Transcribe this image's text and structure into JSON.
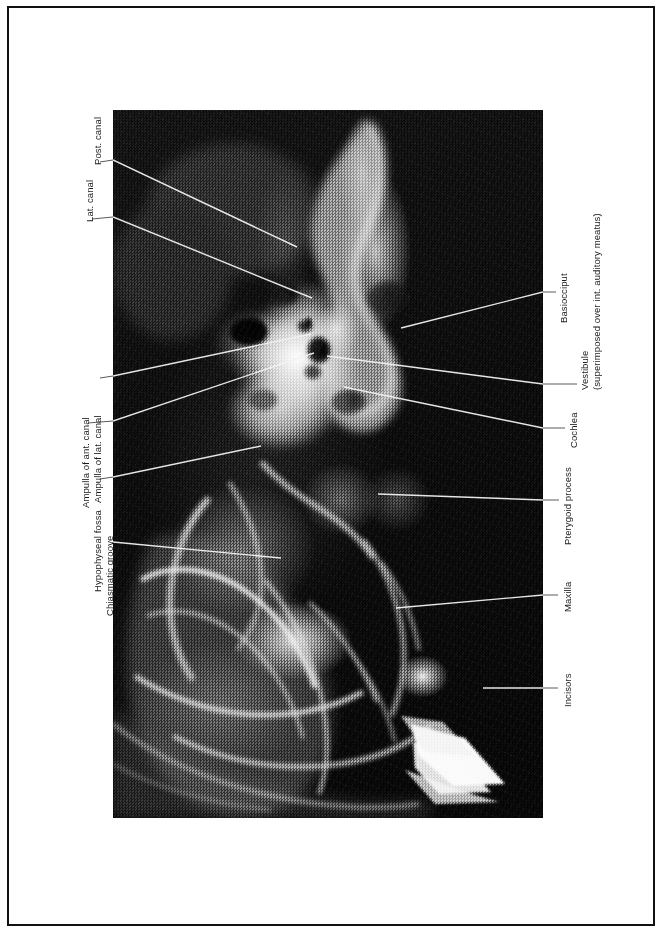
{
  "figure": {
    "kind": "annotated-radiograph",
    "modality": "x-ray",
    "orientation": "rotated-90-ccw",
    "page_background": "#ffffff",
    "border_color": "#111111",
    "label_color": "#1a1a1a",
    "leader_color_on_film": "#f2f2f2",
    "leader_color_on_page": "#5a5a5a",
    "film_color": "#0a0a0a"
  },
  "labels": {
    "left": [
      {
        "id": "post-canal",
        "text": "Post. canal"
      },
      {
        "id": "lat-canal",
        "text": "Lat. canal"
      },
      {
        "id": "ampulla-lat-canal",
        "text": "Ampulla of lat. canal"
      },
      {
        "id": "ampulla-ant-canal",
        "text": "Ampulla of ant. canal"
      },
      {
        "id": "hypophyseal-fossa",
        "text": "Hypophyseal fossa"
      },
      {
        "id": "chiasmatic-groove",
        "text": "Chiasmatic groove"
      }
    ],
    "right": [
      {
        "id": "basiocciput",
        "text": "Basiocciput"
      },
      {
        "id": "vestibule",
        "text": "Vestibule",
        "text2": "(superimposed over int. auditory meatus)"
      },
      {
        "id": "cochlea",
        "text": "Cochlea"
      },
      {
        "id": "pterygoid-process",
        "text": "Pterygoid process"
      },
      {
        "id": "maxilla",
        "text": "Maxilla"
      },
      {
        "id": "incisors",
        "text": "Incisors"
      }
    ]
  }
}
